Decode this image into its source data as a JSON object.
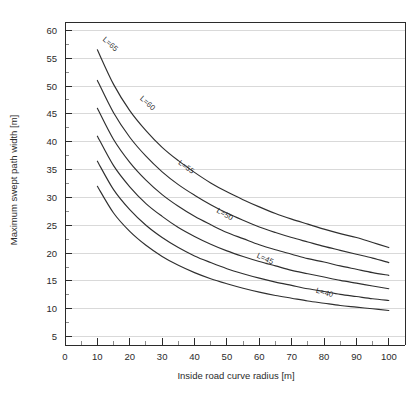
{
  "chart_data": {
    "type": "line",
    "title": "",
    "xlabel": "Inside road curve radius [m]",
    "ylabel": "Maximum swept path width [m]",
    "xlim": [
      0,
      105
    ],
    "ylim": [
      3.5,
      61.5
    ],
    "xticks": [
      0,
      10,
      20,
      30,
      40,
      50,
      60,
      70,
      80,
      90,
      100
    ],
    "xtick_labels": [
      "0",
      "10",
      "20",
      "30",
      "40",
      "50",
      "60",
      "70",
      "80",
      "90",
      "100"
    ],
    "x_minor_step": 5,
    "yticks": [
      5,
      10,
      15,
      20,
      25,
      30,
      35,
      40,
      45,
      50,
      55,
      60
    ],
    "ytick_labels": [
      "5",
      "10",
      "15",
      "20",
      "25",
      "30",
      "35",
      "40",
      "45",
      "50",
      "55",
      "60"
    ],
    "y_minor_step": 2.5,
    "grid": "horizontal-major",
    "legend": "inline-curve-labels",
    "line_color": "#2f2f2f",
    "grid_color": "#cfcfcf",
    "axis_color": "#2b2b2b",
    "x": [
      10,
      15,
      20,
      25,
      30,
      35,
      40,
      45,
      50,
      55,
      60,
      65,
      70,
      75,
      80,
      85,
      90,
      95,
      100
    ],
    "series": [
      {
        "name": "L=65",
        "label": "L=65",
        "label_x": 13.5,
        "label_y": 57.2,
        "label_rotation": 42,
        "values": [
          56.5,
          50.3,
          45.6,
          42.0,
          39.0,
          36.6,
          34.5,
          32.6,
          31.0,
          29.6,
          28.3,
          27.1,
          26.1,
          25.2,
          24.3,
          23.5,
          22.8,
          21.9,
          21.0
        ]
      },
      {
        "name": "L=60",
        "label": "L=60",
        "label_x": 25.0,
        "label_y": 46.6,
        "label_rotation": 42,
        "values": [
          51.0,
          45.2,
          40.8,
          37.4,
          34.6,
          32.3,
          30.4,
          28.7,
          27.2,
          25.9,
          24.7,
          23.7,
          22.8,
          22.0,
          21.2,
          20.5,
          19.8,
          19.1,
          18.3
        ]
      },
      {
        "name": "L=55",
        "label": "L=55",
        "label_x": 37.0,
        "label_y": 35.1,
        "label_rotation": 36,
        "values": [
          46.0,
          40.4,
          36.3,
          33.1,
          30.5,
          28.4,
          26.6,
          25.1,
          23.7,
          22.6,
          21.5,
          20.6,
          19.8,
          19.0,
          18.4,
          17.7,
          17.1,
          16.5,
          16.0
        ]
      },
      {
        "name": "L=50",
        "label": "L=50",
        "label_x": 49.0,
        "label_y": 26.6,
        "label_rotation": 30,
        "values": [
          41.0,
          35.7,
          31.9,
          28.9,
          26.6,
          24.6,
          23.0,
          21.6,
          20.4,
          19.4,
          18.5,
          17.7,
          16.9,
          16.3,
          15.7,
          15.1,
          14.6,
          14.1,
          13.6
        ]
      },
      {
        "name": "L=45",
        "label": "L=45",
        "label_x": 61.5,
        "label_y": 18.6,
        "label_rotation": 25,
        "values": [
          36.5,
          31.4,
          27.8,
          25.0,
          22.8,
          21.0,
          19.5,
          18.3,
          17.2,
          16.3,
          15.5,
          14.8,
          14.2,
          13.6,
          13.1,
          12.6,
          12.2,
          11.8,
          11.5
        ]
      },
      {
        "name": "L=40",
        "label": "L=40",
        "label_x": 80.0,
        "label_y": 12.5,
        "label_rotation": 16,
        "values": [
          32.0,
          27.2,
          23.9,
          21.4,
          19.4,
          17.8,
          16.5,
          15.4,
          14.5,
          13.7,
          13.0,
          12.4,
          11.9,
          11.4,
          11.0,
          10.6,
          10.3,
          10.0,
          9.7
        ]
      }
    ]
  },
  "caption": {
    "clipped_text": ""
  }
}
